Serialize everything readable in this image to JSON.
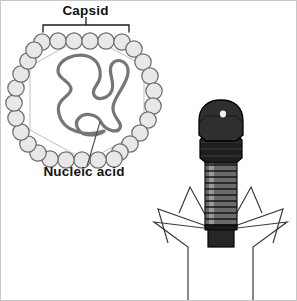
{
  "figure": {
    "background_color": "#ffffff",
    "border_color": "#c8c8c8"
  },
  "labels": {
    "capsid": "Capsid",
    "nucleic_acid": "Nucleic acid"
  },
  "icosahedral_virus": {
    "name": "icosahedral-virus",
    "capsid": {
      "shape": "hexagon",
      "center_x": 86,
      "center_y": 97,
      "radius": 66,
      "capsomere_count": 30,
      "capsomere_radius": 8.2,
      "fill_color": "#e8e8e8",
      "stroke_color": "#6e6e6e"
    },
    "nucleic_acid": {
      "stroke_color": "#767676",
      "stroke_width": 3.2,
      "fill": "none"
    },
    "capsid_bracket": {
      "left_x": 42,
      "right_x": 128,
      "baseline_y": 32,
      "tick_x": 85,
      "tick_top_y": 18,
      "stroke_color": "#1a1a1a"
    },
    "nucleic_acid_leader": {
      "from_x": 99,
      "from_y": 122,
      "to_x": 86,
      "to_y": 165,
      "stroke_color": "#4a4a4a"
    }
  },
  "bacteriophage": {
    "name": "bacteriophage",
    "head": {
      "fill_color": "#2b2b2b",
      "dome_fill": "#333333",
      "stroke_color": "#000000",
      "highlight_color": "#f2f2f2"
    },
    "collar": {
      "fill_color": "#1e1e1e",
      "band_count": 3
    },
    "sheath": {
      "fill_color": "#6a6a6a",
      "highlight_color": "#9a9a9a",
      "ring_count": 11,
      "stroke_color": "#111111"
    },
    "base_plate": {
      "fill_color": "#262626",
      "stroke_color": "#000000"
    },
    "tail_fibers": {
      "count": 6,
      "stroke_color": "#3a3a3a",
      "stroke_width": 1.2
    }
  }
}
